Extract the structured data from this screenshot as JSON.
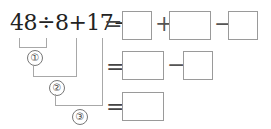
{
  "expression": "48÷8+17−9",
  "row1": {
    "equals": "=",
    "ops": [
      "+",
      "−"
    ],
    "boxes": 3
  },
  "row2": {
    "equals": "=",
    "ops": [
      "−"
    ],
    "boxes": 2
  },
  "row3": {
    "equals": "=",
    "boxes": 1
  },
  "steps": [
    "①",
    "②",
    "③"
  ]
}
